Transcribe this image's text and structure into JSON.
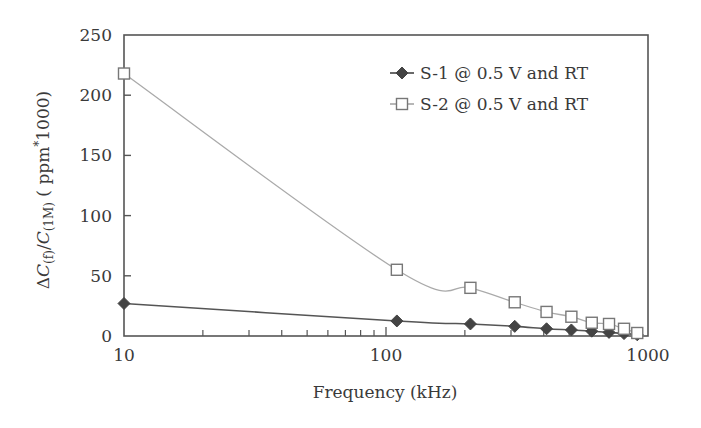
{
  "chart_data": {
    "type": "line",
    "title": "",
    "xlabel": "Frequency (kHz)",
    "ylabel": "ΔC(f)/C(1M) ( ppm*1000)",
    "ylabel_parts": {
      "delta": "Δ",
      "c1": "C",
      "sub1": "(f)",
      "slash": "/",
      "c2": "C",
      "sub2": "(1M)",
      "rest": " ( ppm",
      "star": "*",
      "tail": "1000)"
    },
    "x_scale": "log",
    "xlim": [
      10,
      1000
    ],
    "ylim": [
      0,
      250
    ],
    "x_ticks": [
      10,
      100,
      1000
    ],
    "x_tick_labels": [
      "10",
      "100",
      "1000"
    ],
    "y_ticks": [
      0,
      50,
      100,
      150,
      200,
      250
    ],
    "y_tick_labels": [
      "0",
      "50",
      "100",
      "150",
      "200",
      "250"
    ],
    "grid": false,
    "legend_position": "upper right",
    "x": [
      10,
      110,
      210,
      310,
      410,
      510,
      610,
      710,
      810,
      910
    ],
    "series": [
      {
        "name": "S-1 @ 0.5 V and RT",
        "marker": "diamond-filled",
        "color": "#444444",
        "line_color": "#555555",
        "values": [
          27,
          12.5,
          10,
          8,
          6,
          5,
          4,
          3,
          2,
          1
        ]
      },
      {
        "name": "S-2 @ 0.5 V and RT",
        "marker": "square-open",
        "color": "#888888",
        "line_color": "#aaaaaa",
        "values": [
          218,
          55,
          40,
          28,
          20,
          16,
          11,
          10,
          6,
          2.5
        ]
      }
    ]
  }
}
